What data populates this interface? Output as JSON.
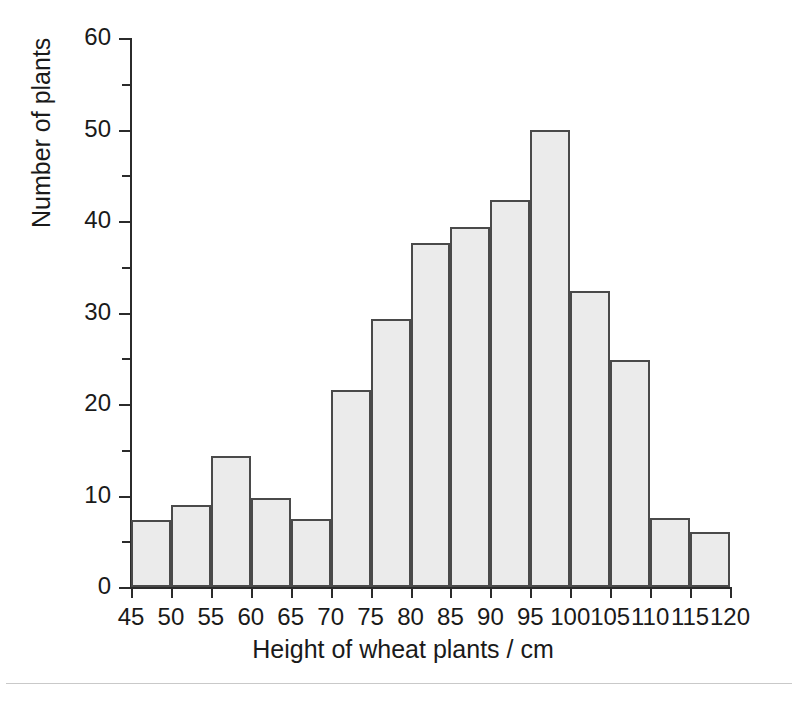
{
  "chart_data": {
    "type": "bar",
    "title": "",
    "xlabel": "Height of wheat plants / cm",
    "ylabel": "Number of plants",
    "xlim": [
      45,
      120
    ],
    "ylim": [
      0,
      60
    ],
    "bin_width": 5,
    "grid": false,
    "legend": null,
    "bar_fill_color": "#ebebeb",
    "bar_edge_color": "#4a4a4a",
    "axis_color": "#2b2b2b",
    "x_tick_labels": [
      "45",
      "50",
      "55",
      "60",
      "65",
      "70",
      "75",
      "80",
      "85",
      "90",
      "95",
      "100",
      "105",
      "110",
      "115",
      "120"
    ],
    "x_tick_values": [
      45,
      50,
      55,
      60,
      65,
      70,
      75,
      80,
      85,
      90,
      95,
      100,
      105,
      110,
      115,
      120
    ],
    "y_tick_labels": [
      "0",
      "10",
      "20",
      "30",
      "40",
      "50",
      "60"
    ],
    "y_tick_values": [
      0,
      10,
      20,
      30,
      40,
      50,
      60
    ],
    "y_minor_tick_values": [
      5,
      15,
      25,
      35,
      45,
      55
    ],
    "bins": [
      {
        "range": "45-50",
        "x0": 45,
        "x1": 50,
        "value": 7.3
      },
      {
        "range": "50-55",
        "x0": 50,
        "x1": 55,
        "value": 9.0
      },
      {
        "range": "55-60",
        "x0": 55,
        "x1": 60,
        "value": 14.3
      },
      {
        "range": "60-65",
        "x0": 60,
        "x1": 65,
        "value": 9.7
      },
      {
        "range": "65-70",
        "x0": 65,
        "x1": 70,
        "value": 7.4
      },
      {
        "range": "70-75",
        "x0": 70,
        "x1": 75,
        "value": 21.5
      },
      {
        "range": "75-80",
        "x0": 75,
        "x1": 80,
        "value": 29.3
      },
      {
        "range": "80-85",
        "x0": 80,
        "x1": 85,
        "value": 37.6
      },
      {
        "range": "85-90",
        "x0": 85,
        "x1": 90,
        "value": 39.4
      },
      {
        "range": "90-95",
        "x0": 90,
        "x1": 95,
        "value": 42.3
      },
      {
        "range": "95-100",
        "x0": 95,
        "x1": 100,
        "value": 50.0
      },
      {
        "range": "100-105",
        "x0": 100,
        "x1": 105,
        "value": 32.3
      },
      {
        "range": "105-110",
        "x0": 105,
        "x1": 110,
        "value": 24.8
      },
      {
        "range": "110-115",
        "x0": 110,
        "x1": 115,
        "value": 7.5
      },
      {
        "range": "115-120",
        "x0": 115,
        "x1": 120,
        "value": 6.0
      }
    ],
    "categories": [
      "45-50",
      "50-55",
      "55-60",
      "60-65",
      "65-70",
      "70-75",
      "75-80",
      "80-85",
      "85-90",
      "90-95",
      "95-100",
      "100-105",
      "105-110",
      "110-115",
      "115-120"
    ],
    "values": [
      7.3,
      9.0,
      14.3,
      9.7,
      7.4,
      21.5,
      29.3,
      37.6,
      39.4,
      42.3,
      50.0,
      32.3,
      24.8,
      7.5,
      6.0
    ]
  }
}
